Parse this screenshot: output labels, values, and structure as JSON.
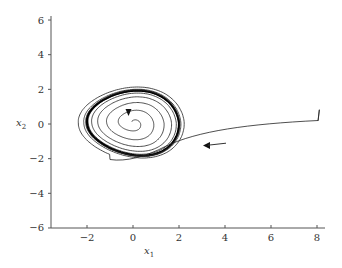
{
  "chart_data": {
    "type": "line",
    "title": "",
    "xlabel": "x1",
    "ylabel": "x2",
    "xlim": [
      -3.5,
      8.3
    ],
    "ylim": [
      -6,
      6.3
    ],
    "grid": false,
    "legend": null,
    "x_ticks": [
      -2,
      0,
      2,
      4,
      6,
      8
    ],
    "y_ticks": [
      -6,
      -4,
      -2,
      0,
      2,
      4,
      6
    ],
    "x_tick_labels": [
      "−2",
      "0",
      "2",
      "4",
      "6",
      "8"
    ],
    "y_tick_labels": [
      "−6",
      "−4",
      "−2",
      "0",
      "2",
      "4",
      "6"
    ],
    "series": [
      {
        "name": "inner-trajectory",
        "description": "Spiral starting near the origin (0, 0) winding outward onto the limit cycle",
        "start": [
          -0.2,
          0.6
        ],
        "center": [
          0,
          0.1
        ],
        "direction": "clockwise-outward"
      },
      {
        "name": "outer-trajectory",
        "description": "Trajectory starting at (8.1, 0.8), moving left, then spiraling inward onto the limit cycle",
        "points": [
          [
            8.1,
            0.8
          ],
          [
            8.05,
            0.2
          ],
          [
            6,
            0.05
          ],
          [
            4,
            -0.3
          ],
          [
            2.5,
            -0.7
          ],
          [
            1.5,
            -1.25
          ],
          [
            0.5,
            -1.75
          ],
          [
            -0.5,
            -2.0
          ],
          [
            -1.6,
            -1.6
          ],
          [
            -2.2,
            -0.6
          ],
          [
            -2.2,
            0.6
          ],
          [
            -1.6,
            1.7
          ],
          [
            -0.3,
            2.25
          ],
          [
            1.2,
            2.05
          ],
          [
            2.2,
            1.0
          ]
        ],
        "direction": "leftward-then-clockwise"
      },
      {
        "name": "limit-cycle",
        "description": "Stable limit cycle (thick line) approx x1 in [-2, 2], x2 in [-1.9, 1.9]",
        "x_range": [
          -2.0,
          2.05
        ],
        "y_range": [
          -1.9,
          1.9
        ]
      }
    ],
    "annotations": [
      {
        "type": "arrow",
        "at": [
          -0.2,
          0.55
        ],
        "direction": "down"
      },
      {
        "type": "arrow",
        "at": [
          3.1,
          -1.2
        ],
        "direction": "left"
      }
    ]
  },
  "axes": {
    "x_label_main": "x",
    "x_label_sub": "1",
    "y_label_main": "x",
    "y_label_sub": "2"
  },
  "colors": {
    "axis": "#555555",
    "curve": "#222222",
    "limit_cycle": "#000000"
  }
}
